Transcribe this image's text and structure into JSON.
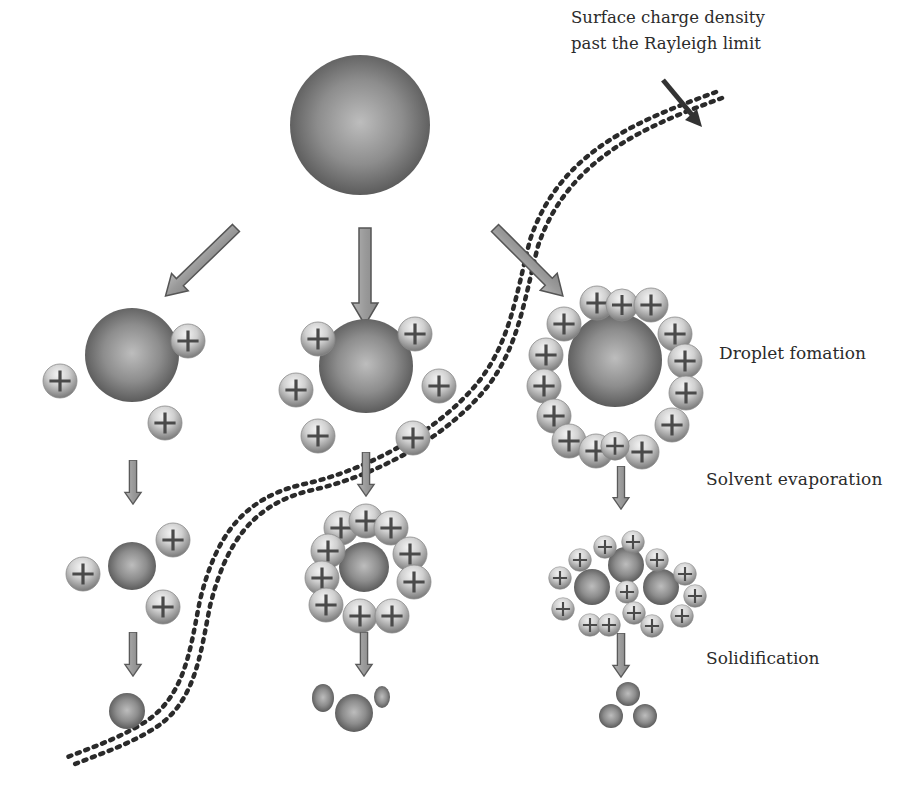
{
  "figure": {
    "type": "process-schematic"
  },
  "callout": {
    "line1": "Surface charge density",
    "line2": "past the Rayleigh limit"
  },
  "stage_labels": {
    "droplet_formation": "Droplet fomation",
    "solvent_evaporation": "Solvent evaporation",
    "solidification": "Solidification"
  },
  "charge_symbol": "+",
  "columns": [
    {
      "name": "low-charge",
      "droplet_charges": 3,
      "evaporated_charges": 3,
      "final_particles": 1
    },
    {
      "name": "medium-charge",
      "droplet_charges": 6,
      "evaporated_charges": 11,
      "final_particles": 3
    },
    {
      "name": "high-charge",
      "droplet_charges": 16,
      "fission_droplets": 3,
      "fission_charges": 14,
      "final_particles": 3
    }
  ],
  "colors": {
    "background": "#ffffff",
    "droplet_dark": "#5a5a5a",
    "droplet_light": "#b8b8b8",
    "arrow_fill": "#9a9a9a",
    "arrow_stroke": "#555555",
    "dotted_path": "#2a2a2a",
    "text": "#2b2b2b"
  }
}
